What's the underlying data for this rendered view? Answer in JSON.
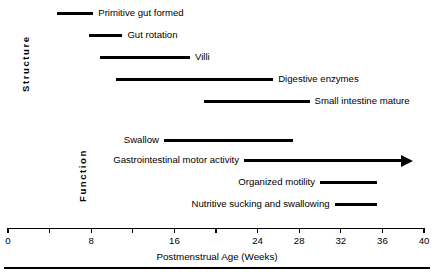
{
  "figure": {
    "width": 434,
    "height": 274,
    "background": "#ffffff",
    "ink_color": "#000000"
  },
  "groups": {
    "structure_label": "Structure",
    "function_label": "Function"
  },
  "axis": {
    "title": "Postmenstrual Age (Weeks)",
    "unit": "Weeks",
    "min": 0,
    "max": 40,
    "tick_values": [
      0,
      4,
      8,
      12,
      16,
      20,
      24,
      28,
      32,
      36,
      40
    ],
    "tick_labels": [
      "0",
      "",
      "8",
      "",
      "16",
      "",
      "24",
      "28",
      "32",
      "36",
      "40"
    ],
    "labeled_ticks": [
      0,
      8,
      16,
      24,
      28,
      32,
      36,
      40
    ]
  },
  "chart_data": {
    "type": "bar",
    "orientation": "horizontal",
    "subtype": "gantt-timeline",
    "title": "",
    "xlabel": "Postmenstrual Age (Weeks)",
    "ylabel": "",
    "xlim": [
      0,
      40
    ],
    "grid": false,
    "legend": false,
    "groups": [
      "Structure",
      "Function"
    ],
    "categories": [
      "Primitive gut formed",
      "Gut rotation",
      "Villi",
      "Digestive enzymes",
      "Small intestine mature",
      "Swallow",
      "Gastrointestinal motor activity",
      "Organized motility",
      "Nutritive sucking and swallowing"
    ],
    "bars": [
      {
        "label": "Primitive gut formed",
        "group": "Structure",
        "start": 4.7,
        "end": 8.2,
        "open_ended": false,
        "label_side": "right"
      },
      {
        "label": "Gut rotation",
        "group": "Structure",
        "start": 7.8,
        "end": 11.0,
        "open_ended": false,
        "label_side": "right"
      },
      {
        "label": "Villi",
        "group": "Structure",
        "start": 8.8,
        "end": 17.5,
        "open_ended": false,
        "label_side": "right"
      },
      {
        "label": "Digestive enzymes",
        "group": "Structure",
        "start": 10.4,
        "end": 25.5,
        "open_ended": false,
        "label_side": "right"
      },
      {
        "label": "Small intestine mature",
        "group": "Structure",
        "start": 18.8,
        "end": 29.0,
        "open_ended": false,
        "label_side": "right"
      },
      {
        "label": "Swallow",
        "group": "Function",
        "start": 15.0,
        "end": 27.4,
        "open_ended": false,
        "label_side": "left"
      },
      {
        "label": "Gastrointestinal motor activity",
        "group": "Function",
        "start": 22.7,
        "end": 38.8,
        "open_ended": true,
        "label_side": "left"
      },
      {
        "label": "Organized motility",
        "group": "Function",
        "start": 30.0,
        "end": 35.5,
        "open_ended": false,
        "label_side": "left"
      },
      {
        "label": "Nutritive sucking and swallowing",
        "group": "Function",
        "start": 31.4,
        "end": 35.5,
        "open_ended": false,
        "label_side": "left"
      }
    ]
  }
}
